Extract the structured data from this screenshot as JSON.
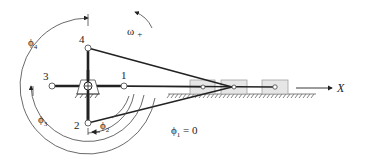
{
  "diagram": {
    "positions": [
      {
        "id": "1",
        "label": "1"
      },
      {
        "id": "2",
        "label": "2"
      },
      {
        "id": "3",
        "label": "3"
      },
      {
        "id": "4",
        "label": "4"
      }
    ],
    "angles": {
      "phi1": {
        "symbol": "ϕ",
        "sub": "1",
        "suffix": " = 0"
      },
      "phi2": {
        "symbol": "ϕ",
        "sub": "2"
      },
      "phi3": {
        "symbol": "ϕ",
        "sub": "3"
      },
      "phi4": {
        "symbol": "ϕ",
        "sub": "4"
      }
    },
    "rotation": {
      "symbol": "ω",
      "sign": "+"
    },
    "axis": {
      "label": "X"
    },
    "colors": {
      "link": "#222222",
      "slider_fill": "#e6e6e6",
      "slider_stroke": "#9a9a9a",
      "arc": "#444444"
    }
  }
}
